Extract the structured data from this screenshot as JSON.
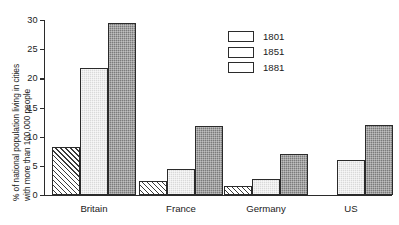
{
  "chart_data": {
    "type": "bar",
    "title": "",
    "xlabel": "",
    "ylabel": "% of national population living in cities with more than 100,000 people",
    "ylabel_line1": "% of national population living in cities",
    "ylabel_line2": "with more than 100,000 people",
    "categories": [
      "Britain",
      "France",
      "Germany",
      "US"
    ],
    "ylim": [
      0,
      30
    ],
    "yticks": [
      0,
      5,
      10,
      15,
      20,
      25,
      30
    ],
    "ytick_labels": [
      "0",
      "5",
      "10",
      "15",
      "20",
      "25",
      "30"
    ],
    "grid": false,
    "legend_position": "top-right",
    "series": [
      {
        "name": "1801",
        "swatch": "white-diagonal-hatch",
        "color": "#ffffff",
        "values": [
          8.3,
          2.5,
          1.6,
          null
        ]
      },
      {
        "name": "1851",
        "swatch": "light-gray",
        "color": "#d9d9d9",
        "values": [
          21.8,
          4.5,
          2.9,
          6.0
        ]
      },
      {
        "name": "1881",
        "swatch": "dark-gray",
        "color": "#7b7b7b",
        "values": [
          29.5,
          11.9,
          7.1,
          12.1
        ]
      }
    ]
  },
  "axis": {
    "line_color": "#2b2b2b"
  }
}
